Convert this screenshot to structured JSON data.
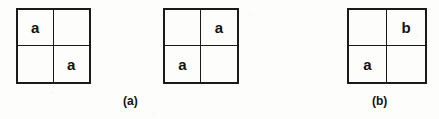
{
  "figure": {
    "background_color": "#fdfdfc",
    "ink_color": "#111111",
    "grids": [
      {
        "name": "grid-1",
        "x": 16,
        "y": 8,
        "width": 75,
        "height": 76,
        "cells": [
          {
            "position": "top-left",
            "label": "a"
          },
          {
            "position": "top-right",
            "label": ""
          },
          {
            "position": "bottom-left",
            "label": ""
          },
          {
            "position": "bottom-right",
            "label": "a"
          }
        ]
      },
      {
        "name": "grid-2",
        "x": 163,
        "y": 8,
        "width": 76,
        "height": 76,
        "cells": [
          {
            "position": "top-left",
            "label": ""
          },
          {
            "position": "top-right",
            "label": "a"
          },
          {
            "position": "bottom-left",
            "label": "a"
          },
          {
            "position": "bottom-right",
            "label": ""
          }
        ]
      },
      {
        "name": "grid-3",
        "x": 347,
        "y": 8,
        "width": 80,
        "height": 76,
        "cells": [
          {
            "position": "top-left",
            "label": ""
          },
          {
            "position": "top-right",
            "label": "b"
          },
          {
            "position": "bottom-left",
            "label": "a"
          },
          {
            "position": "bottom-right",
            "label": ""
          }
        ]
      }
    ],
    "captions": [
      {
        "name": "caption-a",
        "text": "(a)",
        "x": 123,
        "y": 95
      },
      {
        "name": "caption-b",
        "text": "(b)",
        "x": 372,
        "y": 95
      }
    ]
  }
}
